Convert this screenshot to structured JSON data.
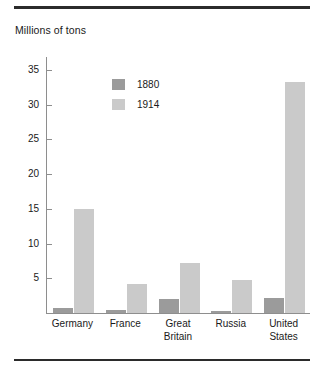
{
  "figure": {
    "axis_title": "Millions of tons"
  },
  "chart_data": {
    "type": "bar",
    "title": "",
    "subtitle": "",
    "xlabel": "",
    "ylabel": "Millions of tons",
    "ylim": [
      0,
      37
    ],
    "yticks": [
      5,
      10,
      15,
      20,
      25,
      30,
      35
    ],
    "grid": false,
    "legend_position": "inside-upper-left",
    "categories": [
      "Germany",
      "France",
      "Great\nBritain",
      "Russia",
      "United\nStates"
    ],
    "series": [
      {
        "name": "1880",
        "color": "#9b9b9b",
        "values": [
          0.7,
          0.4,
          2.0,
          0.3,
          2.2
        ]
      },
      {
        "name": "1914",
        "color": "#cacaca",
        "values": [
          15.0,
          4.2,
          7.2,
          4.8,
          33.2
        ]
      }
    ]
  },
  "legend": {
    "entries": [
      {
        "label": "1880",
        "color": "#9b9b9b"
      },
      {
        "label": "1914",
        "color": "#cacaca"
      }
    ]
  },
  "colors": {
    "rule": "#2b2b2b",
    "axis": "#8e8e8e",
    "series_1880": "#9b9b9b",
    "series_1914": "#cacaca",
    "text": "#1a1a1a",
    "background": "#ffffff"
  }
}
